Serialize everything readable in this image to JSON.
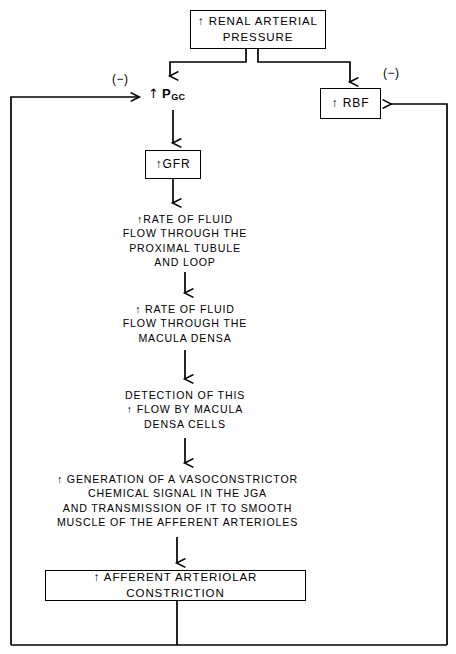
{
  "diagram": {
    "up_arrow": "↑",
    "boxes": {
      "renal_arterial_pressure": "↑ RENAL ARTERIAL\nPRESSURE",
      "rbf": "↑ RBF",
      "gfr": "↑GFR",
      "afferent_arteriolar_constriction": "↑ AFFERENT ARTERIOLAR CONSTRICTION"
    },
    "nodes": {
      "pgc_arrow": "↑",
      "pgc_symbol": "P",
      "pgc_subscript": "GC",
      "rate_flow_proximal": "↑RATE OF FLUID\nFLOW THROUGH THE\nPROXIMAL TUBULE\nAND LOOP",
      "rate_flow_macula": "↑ RATE OF FLUID\nFLOW THROUGH THE\nMACULA DENSA",
      "detection": "DETECTION OF THIS\n↑ FLOW BY MACULA\nDENSA CELLS",
      "generation": "↑ GENERATION OF A VASOCONSTRICTOR\nCHEMICAL SIGNAL IN THE JGA\nAND TRANSMISSION OF IT TO SMOOTH\nMUSCLE OF THE AFFERENT ARTERIOLES"
    },
    "feedback_labels": {
      "left_negative": "(−)",
      "right_negative": "(−)"
    },
    "colors": {
      "line": "#000000",
      "background": "#ffffff",
      "text": "#000000"
    }
  }
}
